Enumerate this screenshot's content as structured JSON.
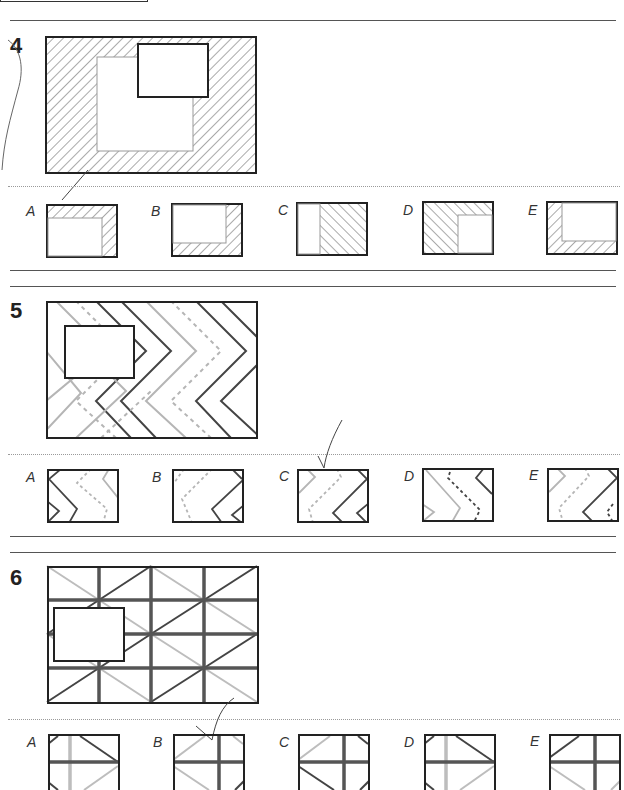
{
  "page": {
    "type": "pattern-completion worksheet",
    "questions": [
      {
        "number": "4",
        "pattern": "diagonal-hatched frame with grey inner square",
        "options": [
          {
            "label": "A"
          },
          {
            "label": "B"
          },
          {
            "label": "C"
          },
          {
            "label": "D"
          },
          {
            "label": "E"
          }
        ]
      },
      {
        "number": "5",
        "pattern": "zigzag chevrons (dark solid, grey solid, grey dashed)",
        "options": [
          {
            "label": "A"
          },
          {
            "label": "B"
          },
          {
            "label": "C"
          },
          {
            "label": "D"
          },
          {
            "label": "E"
          }
        ]
      },
      {
        "number": "6",
        "pattern": "grid with diagonal lines",
        "options": [
          {
            "label": "A"
          },
          {
            "label": "B"
          },
          {
            "label": "C"
          },
          {
            "label": "D"
          },
          {
            "label": "E"
          }
        ]
      }
    ]
  },
  "colors": {
    "dark_line": "#333333",
    "grey_line": "#b0b0b0",
    "hatch": "#555555"
  }
}
